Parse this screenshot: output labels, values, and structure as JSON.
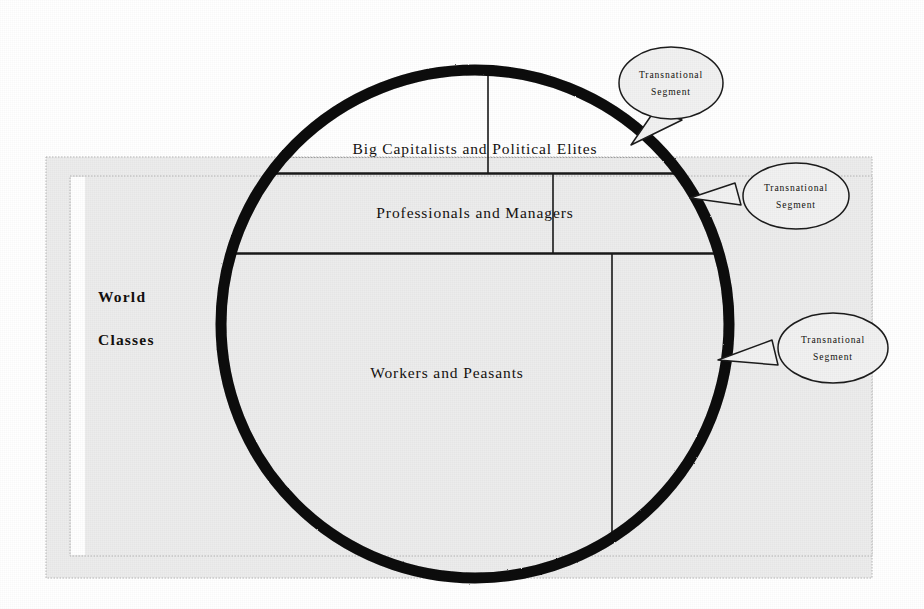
{
  "diagram": {
    "title_label_lines": [
      "World",
      "Classes"
    ],
    "class_strata": [
      {
        "id": "elites",
        "label": "Big Capitalists and Political Elites"
      },
      {
        "id": "professionals",
        "label": "Professionals and Managers"
      },
      {
        "id": "workers",
        "label": "Workers and Peasants"
      }
    ],
    "callouts": [
      {
        "id": "callout-top",
        "line1": "Transnational",
        "line2": "Segment"
      },
      {
        "id": "callout-middle",
        "line1": "Transnational",
        "line2": "Segment"
      },
      {
        "id": "callout-bottom",
        "line1": "Transnational",
        "line2": "Segment"
      }
    ],
    "colors": {
      "page_background": "#ffffff",
      "panel_fill": "#ececec",
      "panel_border": "#b9b9b9",
      "circle_stroke": "#0a0a0a",
      "rule_stroke": "#1a1a1a",
      "text": "#14110f",
      "callout_fill": "#f1f1f1",
      "callout_stroke": "#1c1c1c"
    },
    "geometry": {
      "circle_center_x": 475,
      "circle_center_y": 324,
      "circle_radius": 254,
      "panel_outer": {
        "x": 46,
        "y": 157,
        "width": 826,
        "height": 421
      },
      "panel_inner_band": {
        "x": 70,
        "y": 176,
        "width": 16,
        "height": 380
      }
    }
  }
}
